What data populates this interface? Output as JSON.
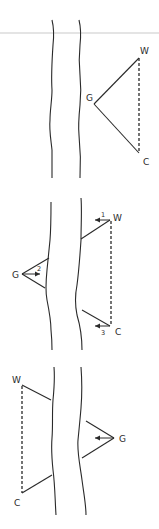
{
  "diagram": {
    "colors": {
      "ink": "#2a2a2a",
      "background": "#ffffff",
      "top_rule": "#e4e4e4"
    },
    "panels": [
      {
        "id": "panel-1",
        "description": "Triangle G-W-C on right side of channel, W-C dashed",
        "labels": {
          "w": "W",
          "g": "G",
          "c": "C"
        }
      },
      {
        "id": "panel-2",
        "description": "Triangle with G on left bank, W and C on right, numbered arrows",
        "labels": {
          "w": "W",
          "g": "G",
          "c": "C"
        },
        "arrow_numbers": {
          "a1": "1",
          "a2": "2",
          "a3": "3"
        }
      },
      {
        "id": "panel-3",
        "description": "W and C on left side dashed, G on right with arrow",
        "labels": {
          "w": "W",
          "g": "G",
          "c": "C"
        }
      }
    ]
  }
}
